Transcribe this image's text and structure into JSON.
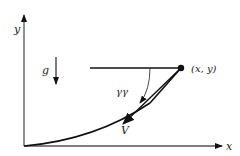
{
  "diagram": {
    "labels": {
      "y_axis": "y",
      "x_axis": "x",
      "gravity": "g",
      "point": "(x, y)",
      "angle": "γγ",
      "velocity": "V"
    },
    "colors": {
      "stroke": "#111111",
      "background": "#ffffff"
    }
  }
}
